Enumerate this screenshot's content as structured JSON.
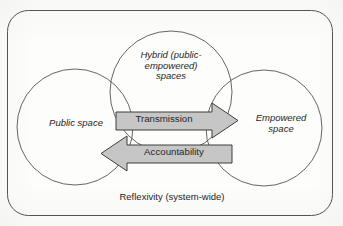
{
  "figure": {
    "container_label": "Reflexivity (system-wide)",
    "outline_color": "#555555",
    "arrow_fill_color": "#c6c6c6",
    "arrow_stroke_color": "#3d3d3d",
    "background_color": "#fdfdfc",
    "text_color": "#262626"
  },
  "circles": [
    {
      "id": "public",
      "label": "Public space"
    },
    {
      "id": "hybrid",
      "label": "Hybrid (public-\nempowered)\nspaces"
    },
    {
      "id": "empowered",
      "label": "Empowered\nspace"
    }
  ],
  "arrows": [
    {
      "id": "transmission",
      "label": "Transmission",
      "direction": "right"
    },
    {
      "id": "accountability",
      "label": "Accountability",
      "direction": "left"
    }
  ]
}
